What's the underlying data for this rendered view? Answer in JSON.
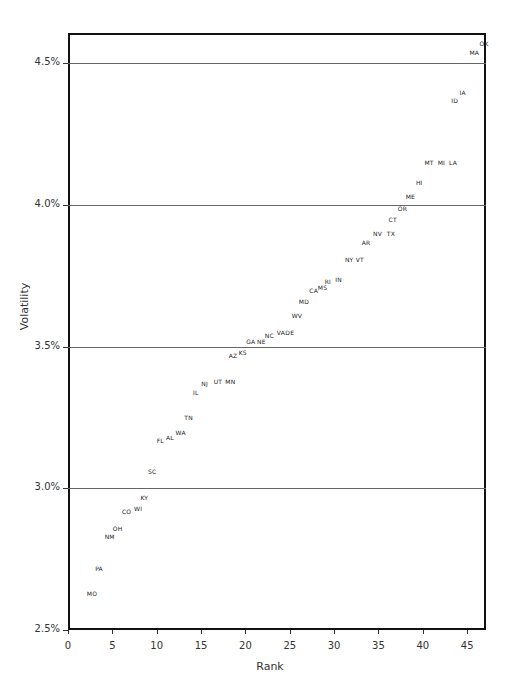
{
  "chart_data": {
    "type": "scatter",
    "title": "",
    "xlabel": "Rank",
    "ylabel": "Volatility",
    "xlim": [
      0,
      47
    ],
    "ylim": [
      2.5,
      4.6
    ],
    "x_ticks": [
      "0",
      "5",
      "10",
      "15",
      "20",
      "25",
      "30",
      "35",
      "40",
      "45"
    ],
    "y_ticks": [
      "2.5%",
      "3.0%",
      "3.5%",
      "4.0%",
      "4.5%"
    ],
    "grid": {
      "horizontal": true,
      "vertical": false
    },
    "legend": null,
    "marker": "text-label",
    "points": [
      {
        "label": "MO",
        "x": 2.7,
        "y": 2.63
      },
      {
        "label": "PA",
        "x": 3.5,
        "y": 2.72
      },
      {
        "label": "NM",
        "x": 4.7,
        "y": 2.83
      },
      {
        "label": "OH",
        "x": 5.6,
        "y": 2.86
      },
      {
        "label": "CO",
        "x": 6.6,
        "y": 2.92
      },
      {
        "label": "WI",
        "x": 7.9,
        "y": 2.93
      },
      {
        "label": "KY",
        "x": 8.6,
        "y": 2.97
      },
      {
        "label": "SC",
        "x": 9.5,
        "y": 3.06
      },
      {
        "label": "FL",
        "x": 10.4,
        "y": 3.17
      },
      {
        "label": "AL",
        "x": 11.5,
        "y": 3.18
      },
      {
        "label": "WA",
        "x": 12.7,
        "y": 3.2
      },
      {
        "label": "TN",
        "x": 13.6,
        "y": 3.25
      },
      {
        "label": "IL",
        "x": 14.4,
        "y": 3.34
      },
      {
        "label": "NJ",
        "x": 15.4,
        "y": 3.37
      },
      {
        "label": "UT",
        "x": 16.9,
        "y": 3.38
      },
      {
        "label": "MN",
        "x": 18.3,
        "y": 3.38
      },
      {
        "label": "AZ",
        "x": 18.6,
        "y": 3.47
      },
      {
        "label": "KS",
        "x": 19.7,
        "y": 3.48
      },
      {
        "label": "GA",
        "x": 20.6,
        "y": 3.52
      },
      {
        "label": "NE",
        "x": 21.8,
        "y": 3.52
      },
      {
        "label": "NC",
        "x": 22.7,
        "y": 3.54
      },
      {
        "label": "VA",
        "x": 24.0,
        "y": 3.55
      },
      {
        "label": "DE",
        "x": 25.0,
        "y": 3.55
      },
      {
        "label": "WV",
        "x": 25.8,
        "y": 3.61
      },
      {
        "label": "MD",
        "x": 26.6,
        "y": 3.66
      },
      {
        "label": "CA",
        "x": 27.7,
        "y": 3.7
      },
      {
        "label": "MS",
        "x": 28.7,
        "y": 3.71
      },
      {
        "label": "RI",
        "x": 29.3,
        "y": 3.73
      },
      {
        "label": "IN",
        "x": 30.5,
        "y": 3.74
      },
      {
        "label": "NY",
        "x": 31.7,
        "y": 3.81
      },
      {
        "label": "VT",
        "x": 32.9,
        "y": 3.81
      },
      {
        "label": "AR",
        "x": 33.6,
        "y": 3.87
      },
      {
        "label": "NV",
        "x": 34.9,
        "y": 3.9
      },
      {
        "label": "TX",
        "x": 36.4,
        "y": 3.9
      },
      {
        "label": "CT",
        "x": 36.6,
        "y": 3.95
      },
      {
        "label": "OR",
        "x": 37.7,
        "y": 3.99
      },
      {
        "label": "ME",
        "x": 38.6,
        "y": 4.03
      },
      {
        "label": "HI",
        "x": 39.6,
        "y": 4.08
      },
      {
        "label": "MT",
        "x": 40.7,
        "y": 4.15
      },
      {
        "label": "MI",
        "x": 42.1,
        "y": 4.15
      },
      {
        "label": "LA",
        "x": 43.4,
        "y": 4.15
      },
      {
        "label": "ID",
        "x": 43.6,
        "y": 4.37
      },
      {
        "label": "IA",
        "x": 44.5,
        "y": 4.4
      },
      {
        "label": "MA",
        "x": 45.8,
        "y": 4.54
      },
      {
        "label": "OK",
        "x": 46.9,
        "y": 4.57
      }
    ]
  }
}
